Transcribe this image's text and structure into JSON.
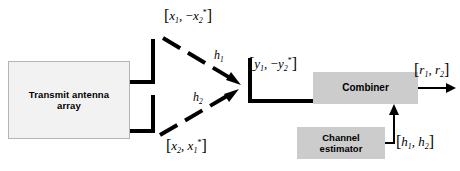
{
  "diagram": {
    "canvas": {
      "width": 460,
      "height": 171,
      "background": "#ffffff"
    },
    "boxes": {
      "transmit": {
        "label_line1": "Transmit antenna",
        "label_line2": "array",
        "fill": "#f2f2f2",
        "border": "#b4b4b4"
      },
      "combiner": {
        "label": "Combiner",
        "fill": "#cccccc"
      },
      "estimator": {
        "label_line1": "Channel",
        "label_line2": "estimator",
        "fill": "#cccccc"
      }
    },
    "labels": {
      "tx_top": {
        "open": "[",
        "v1": "x",
        "s1": "1",
        "sep": ", −",
        "v2": "x",
        "s2": "2",
        "star": "*",
        "close": "]"
      },
      "tx_bottom": {
        "open": "[",
        "v1": "x",
        "s1": "2",
        "sep": ", ",
        "v2": "x",
        "s2": "1",
        "star": "*",
        "close": "]"
      },
      "rx_signal": {
        "open": "[",
        "v1": "y",
        "s1": "1",
        "sep": ", −",
        "v2": "y",
        "s2": "2",
        "star": "*",
        "close": "]"
      },
      "output": {
        "open": "[",
        "v1": "r",
        "s1": "1",
        "sep": ", ",
        "v2": "r",
        "s2": "2",
        "close": "]"
      },
      "channel_estimate": {
        "open": "[",
        "v1": "h",
        "s1": "1",
        "sep": ", ",
        "v2": "h",
        "s2": "2",
        "close": "]"
      },
      "h1": {
        "sym": "h",
        "sub": "1"
      },
      "h2": {
        "sym": "h",
        "sub": "2"
      }
    },
    "colors": {
      "line": "#000000",
      "box_gray": "#cccccc",
      "box_light": "#f2f2f2",
      "border_gray": "#b4b4b4"
    }
  }
}
